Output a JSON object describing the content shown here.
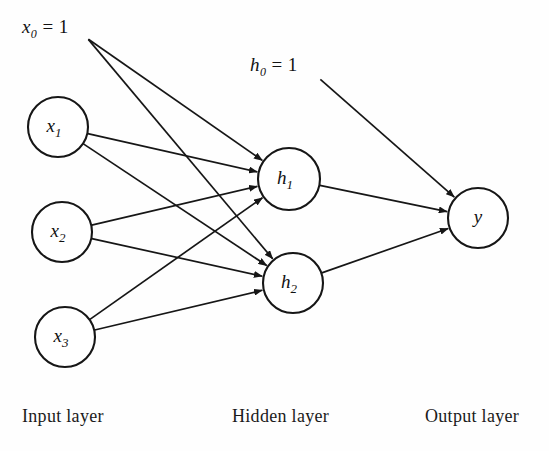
{
  "figure": {
    "type": "diagram",
    "subtype": "neural-network-architecture",
    "background_color": "#fefefe",
    "ink_color": "#161616",
    "width": 549,
    "height": 451
  },
  "nodes": {
    "input": [
      {
        "id": "x1",
        "label": "x",
        "sub": "1",
        "cx": 58,
        "cy": 127,
        "r": 30
      },
      {
        "id": "x2",
        "label": "x",
        "sub": "2",
        "cx": 62,
        "cy": 232,
        "r": 30
      },
      {
        "id": "x3",
        "label": "x",
        "sub": "3",
        "cx": 65,
        "cy": 337,
        "r": 30
      }
    ],
    "hidden": [
      {
        "id": "h1",
        "label": "h",
        "sub": "1",
        "cx": 289,
        "cy": 179,
        "r": 31
      },
      {
        "id": "h2",
        "label": "h",
        "sub": "2",
        "cx": 293,
        "cy": 283,
        "r": 30
      }
    ],
    "output": [
      {
        "id": "y",
        "label": "y",
        "sub": "",
        "cx": 478,
        "cy": 218,
        "r": 30
      }
    ]
  },
  "bias_labels": [
    {
      "id": "x0",
      "text": "x",
      "sub": "0",
      "equals": "= 1",
      "x": 22,
      "y": 16,
      "origin_x": 88,
      "origin_y": 39
    },
    {
      "id": "h0",
      "text": "h",
      "sub": "0",
      "equals": "= 1",
      "x": 250,
      "y": 54,
      "origin_x": 320,
      "origin_y": 79
    }
  ],
  "edges": [
    {
      "from": "x0",
      "to": "h1"
    },
    {
      "from": "x0",
      "to": "h2"
    },
    {
      "from": "x1",
      "to": "h1"
    },
    {
      "from": "x1",
      "to": "h2"
    },
    {
      "from": "x2",
      "to": "h1"
    },
    {
      "from": "x2",
      "to": "h2"
    },
    {
      "from": "x3",
      "to": "h1"
    },
    {
      "from": "x3",
      "to": "h2"
    },
    {
      "from": "h0",
      "to": "y"
    },
    {
      "from": "h1",
      "to": "y"
    },
    {
      "from": "h2",
      "to": "y"
    }
  ],
  "layer_labels": [
    {
      "id": "input-layer",
      "text": "Input layer",
      "x": 22,
      "y": 406
    },
    {
      "id": "hidden-layer",
      "text": "Hidden layer",
      "x": 232,
      "y": 406
    },
    {
      "id": "output-layer",
      "text": "Output layer",
      "x": 425,
      "y": 406
    }
  ]
}
